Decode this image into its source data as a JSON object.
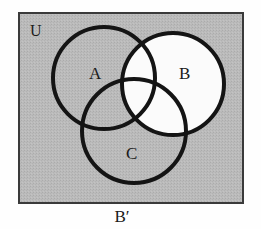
{
  "figure": {
    "type": "venn-diagram",
    "sets": 3,
    "universe_label": "U",
    "caption": "B′",
    "shaded_region_description": "B′",
    "labels": {
      "a": "A",
      "b": "B",
      "c": "C"
    },
    "colors": {
      "page_background": "#fefefe",
      "universe_fill": "#b9b9b9",
      "universe_border": "#3a3a3a",
      "shaded_fill": "#b9b9b9",
      "unshaded_fill": "#fbfbfb",
      "circle_stroke": "#141414",
      "text": "#1a1a1a"
    },
    "geometry": {
      "rect": {
        "x": 19,
        "y": 13,
        "width": 224,
        "height": 190
      },
      "circle_a": {
        "cx": 104,
        "cy": 78,
        "r": 51
      },
      "circle_b": {
        "cx": 173,
        "cy": 84,
        "r": 51
      },
      "circle_c": {
        "cx": 134,
        "cy": 131,
        "r": 52
      },
      "stroke_width": 4
    },
    "label_positions": {
      "universe": {
        "x": 30,
        "y": 36
      },
      "a": {
        "x": 89,
        "y": 79
      },
      "b": {
        "x": 179,
        "y": 79
      },
      "c": {
        "x": 126,
        "y": 159
      },
      "caption": {
        "x": 122,
        "y": 222
      }
    }
  }
}
